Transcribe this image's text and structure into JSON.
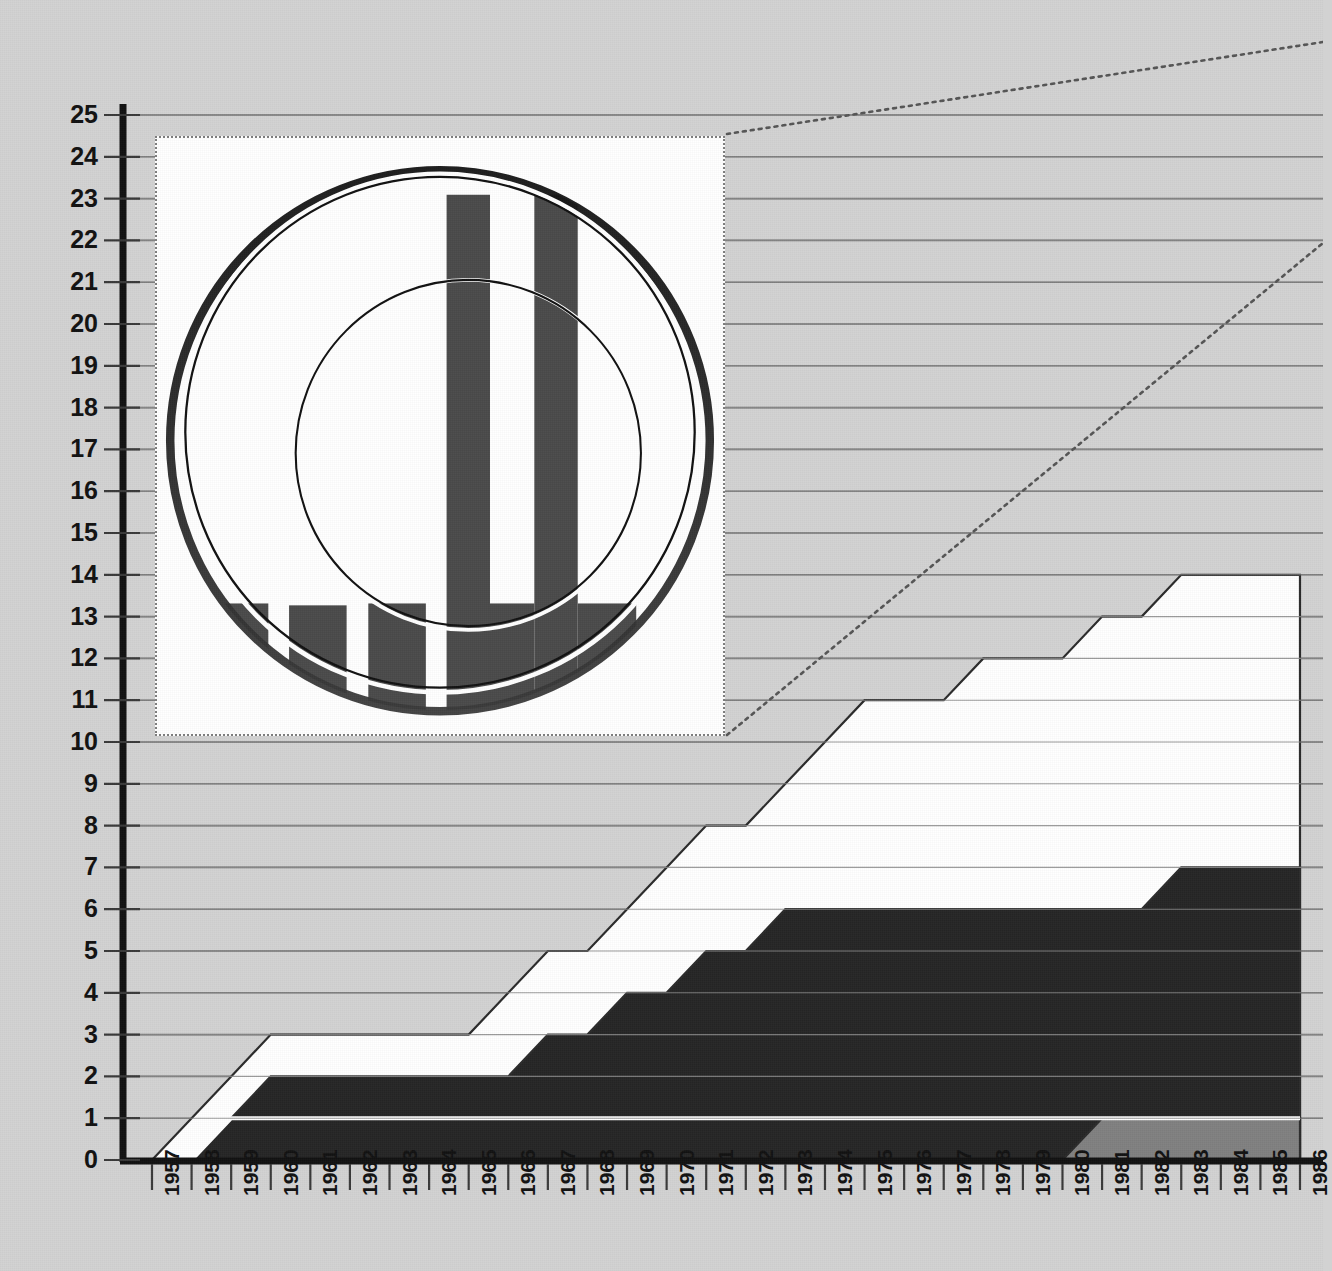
{
  "figure": {
    "name": "stacked-area-timeline-with-magnifier-inset",
    "background_color": "#d2d2d2",
    "axis_color": "#111111",
    "gridline_color": "#6f6f6f"
  },
  "chart_data": {
    "type": "area",
    "title": "",
    "subtitle": "",
    "xlabel": "",
    "ylabel": "",
    "grid": true,
    "legend_position": "none",
    "stacked": true,
    "xlim": [
      1957,
      1986
    ],
    "ylim": [
      0,
      25
    ],
    "x": [
      1957,
      1958,
      1959,
      1960,
      1961,
      1962,
      1963,
      1964,
      1965,
      1966,
      1967,
      1968,
      1969,
      1970,
      1971,
      1972,
      1973,
      1974,
      1975,
      1976,
      1977,
      1978,
      1979,
      1980,
      1981,
      1982,
      1983,
      1984,
      1985,
      1986
    ],
    "categories": [
      "1957",
      "1958",
      "1959",
      "1960",
      "1961",
      "1962",
      "1963",
      "1964",
      "1965",
      "1966",
      "1967",
      "1968",
      "1969",
      "1970",
      "1971",
      "1972",
      "1973",
      "1974",
      "1975",
      "1976",
      "1977",
      "1978",
      "1979",
      "1980",
      "1981",
      "1982",
      "1983",
      "1984",
      "1985",
      "1986"
    ],
    "yticks": [
      0,
      1,
      2,
      3,
      4,
      5,
      6,
      7,
      8,
      9,
      10,
      11,
      12,
      13,
      14,
      15,
      16,
      17,
      18,
      19,
      20,
      21,
      22,
      23,
      24,
      25
    ],
    "ytick_labels": [
      "0",
      "1",
      "2",
      "3",
      "4",
      "5",
      "6",
      "7",
      "8",
      "9",
      "10",
      "11",
      "12",
      "13",
      "14",
      "15",
      "16",
      "17",
      "18",
      "19",
      "20",
      "21",
      "22",
      "23",
      "24",
      "25"
    ],
    "series": [
      {
        "name": "series-grey-base",
        "color": "#808080",
        "order": 1,
        "cumulative_top": [
          0,
          0,
          0,
          0,
          0,
          0,
          0,
          0,
          0,
          0,
          0,
          0,
          0,
          0,
          0,
          0,
          0,
          0,
          0,
          0,
          0,
          0,
          0,
          0,
          1,
          1,
          1,
          1,
          1,
          1
        ]
      },
      {
        "name": "series-dark",
        "color": "#262626",
        "order": 2,
        "cumulative_top": [
          0,
          0,
          1,
          1,
          1,
          1,
          1,
          1,
          1,
          1,
          1,
          1,
          1,
          1,
          1,
          1,
          1,
          1,
          1,
          1,
          1,
          1,
          1,
          1,
          1,
          1,
          1,
          1,
          1,
          1
        ]
      },
      {
        "name": "series-dark-upper",
        "color": "#262626",
        "order": 3,
        "cumulative_top": [
          0,
          0,
          1,
          2,
          2,
          2,
          2,
          2,
          2,
          2,
          3,
          3,
          4,
          4,
          5,
          5,
          6,
          6,
          6,
          6,
          6,
          6,
          6,
          6,
          6,
          6,
          7,
          7,
          7,
          7
        ]
      },
      {
        "name": "series-white",
        "color": "#ffffff",
        "order": 4,
        "cumulative_top": [
          0,
          1,
          2,
          3,
          3,
          3,
          3,
          3,
          3,
          4,
          5,
          5,
          6,
          7,
          8,
          8,
          9,
          10,
          11,
          11,
          11,
          12,
          12,
          12,
          13,
          13,
          14,
          14,
          14,
          14
        ]
      }
    ],
    "annotations": [
      {
        "name": "magnifier-inset",
        "kind": "callout",
        "description": "circular loupe magnifying a bar-chart region"
      },
      {
        "name": "leader-line-top",
        "kind": "dotted-line"
      },
      {
        "name": "leader-line-bottom",
        "kind": "dotted-line"
      }
    ]
  },
  "inset": {
    "name": "magnifier-loupe",
    "background": "#ffffff",
    "border_style": "dotted",
    "border_color": "#7d7d7d",
    "bar_color": "#4a4a4a",
    "ring_color": "#111111",
    "bars": [
      {
        "x": 57,
        "w": 61,
        "y": 492,
        "h": 290
      },
      {
        "x": 140,
        "w": 61,
        "y": 494,
        "h": 290
      },
      {
        "x": 224,
        "w": 61,
        "y": 492,
        "h": 290
      },
      {
        "x": 307,
        "w": 46,
        "y": 60,
        "h": 722
      },
      {
        "x": 353,
        "w": 47,
        "y": 492,
        "h": 290
      },
      {
        "x": 400,
        "w": 46,
        "y": 60,
        "h": 722
      },
      {
        "x": 446,
        "w": 62,
        "y": 492,
        "h": 290
      },
      {
        "x": 531,
        "w": 61,
        "y": 492,
        "h": 290
      }
    ],
    "blocks": [
      {
        "name": "lower-left-dark-block",
        "x": 20,
        "y": 782,
        "w": 321,
        "h": 172
      },
      {
        "name": "baseline-grey-band",
        "x": 20,
        "y": 954,
        "w": 560,
        "h": 38
      }
    ]
  }
}
